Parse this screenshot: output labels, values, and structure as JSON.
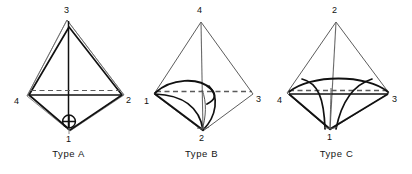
{
  "figure": {
    "background_color": "#ffffff",
    "line_color": "#111111",
    "thin_line_color": "#555555",
    "dashed_line_color": "#666666",
    "panels": [
      {
        "id": "type-a",
        "caption": "Type A",
        "vertices": {
          "top": "3",
          "left": "4",
          "right": "2",
          "bottom": "1"
        },
        "marker_icon": "crossed-circle-icon"
      },
      {
        "id": "type-b",
        "caption": "Type B",
        "vertices": {
          "top": "4",
          "left": "1",
          "right": "3",
          "bottom": "2"
        },
        "marker_icon": "none"
      },
      {
        "id": "type-c",
        "caption": "Type C",
        "vertices": {
          "top": "2",
          "left": "4",
          "right": "3",
          "bottom": "1"
        },
        "marker_icon": "none"
      }
    ]
  }
}
